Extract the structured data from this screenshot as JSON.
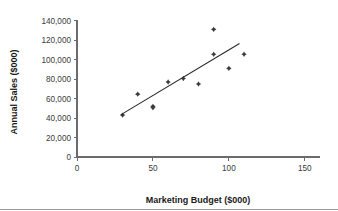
{
  "chart_data": {
    "type": "scatter",
    "title": "",
    "xlabel": "Marketing Budget ($000)",
    "ylabel": "Annual Sales ($000)",
    "xlim": [
      0,
      160
    ],
    "ylim": [
      0,
      140000
    ],
    "xticks": [
      0,
      50,
      100,
      150
    ],
    "xtick_labels": [
      "0",
      "50",
      "100",
      "150"
    ],
    "yticks": [
      0,
      20000,
      40000,
      60000,
      80000,
      100000,
      120000,
      140000
    ],
    "ytick_labels": [
      "0",
      "20,000",
      "40,000",
      "60,000",
      "80,000",
      "100,000",
      "120,000",
      "140,000"
    ],
    "grid": false,
    "legend": false,
    "marker_color": "#3b3b3b",
    "trendline_color": "#2b2b2b",
    "axis_color": "#6b6b6b",
    "points": [
      {
        "x": 30,
        "y": 43000
      },
      {
        "x": 40,
        "y": 64500
      },
      {
        "x": 50,
        "y": 52000
      },
      {
        "x": 50,
        "y": 50500
      },
      {
        "x": 60,
        "y": 77000
      },
      {
        "x": 70,
        "y": 80500
      },
      {
        "x": 80,
        "y": 75000
      },
      {
        "x": 90,
        "y": 131000
      },
      {
        "x": 90,
        "y": 105500
      },
      {
        "x": 100,
        "y": 91000
      },
      {
        "x": 110,
        "y": 105500
      }
    ],
    "trendline": {
      "name": "linear-fit",
      "x_start": 29,
      "y_start": 43500,
      "x_end": 107,
      "y_end": 116500
    }
  },
  "axes": {
    "y_title": "Annual Sales ($000)",
    "x_title": "Marketing Budget ($000)"
  }
}
